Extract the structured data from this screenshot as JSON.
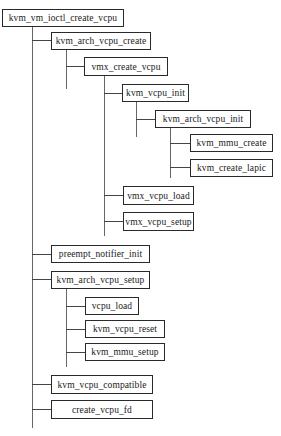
{
  "diagram": {
    "type": "call-tree",
    "colors": {
      "line": "#666666",
      "border": "#2a2a2a",
      "text": "#1a1a1a",
      "background": "#ffffff"
    },
    "nodes": {
      "root": "kvm_vm_ioctl_create_vcpu",
      "kvm_arch_vcpu_create": "kvm_arch_vcpu_create",
      "vmx_create_vcpu": "vmx_create_vcpu",
      "kvm_vcpu_init": "kvm_vcpu_init",
      "kvm_arch_vcpu_init": "kvm_arch_vcpu_init",
      "kvm_mmu_create": "kvm_mmu_create",
      "kvm_create_lapic": "kvm_create_lapic",
      "vmx_vcpu_load": "vmx_vcpu_load",
      "vmx_vcpu_setup": "vmx_vcpu_setup",
      "preempt_notifier_init": "preempt_notifier_init",
      "kvm_arch_vcpu_setup": "kvm_arch_vcpu_setup",
      "vcpu_load": "vcpu_load",
      "kvm_vcpu_reset": "kvm_vcpu_reset",
      "kvm_mmu_setup": "kvm_mmu_setup",
      "kvm_vcpu_compatible": "kvm_vcpu_compatible",
      "create_vcpu_fd": "create_vcpu_fd"
    },
    "tree": {
      "label": "kvm_vm_ioctl_create_vcpu",
      "children": [
        {
          "label": "kvm_arch_vcpu_create",
          "children": [
            {
              "label": "vmx_create_vcpu",
              "children": [
                {
                  "label": "kvm_vcpu_init",
                  "children": [
                    {
                      "label": "kvm_arch_vcpu_init",
                      "children": [
                        {
                          "label": "kvm_mmu_create"
                        },
                        {
                          "label": "kvm_create_lapic"
                        }
                      ]
                    }
                  ]
                },
                {
                  "label": "vmx_vcpu_load"
                },
                {
                  "label": "vmx_vcpu_setup"
                }
              ]
            }
          ]
        },
        {
          "label": "preempt_notifier_init"
        },
        {
          "label": "kvm_arch_vcpu_setup",
          "children": [
            {
              "label": "vcpu_load"
            },
            {
              "label": "kvm_vcpu_reset"
            },
            {
              "label": "kvm_mmu_setup"
            }
          ]
        },
        {
          "label": "kvm_vcpu_compatible"
        },
        {
          "label": "create_vcpu_fd"
        }
      ]
    }
  }
}
